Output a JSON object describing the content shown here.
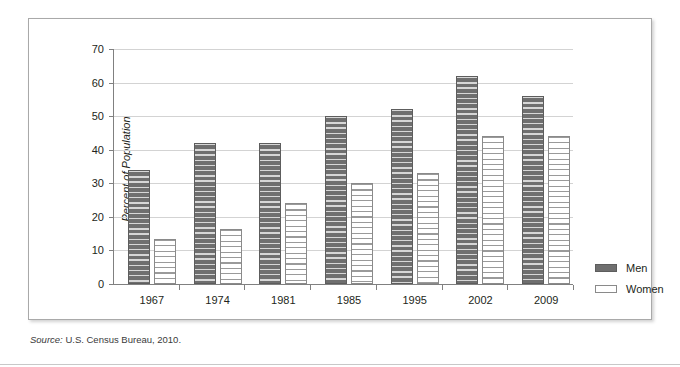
{
  "chart_data": {
    "type": "bar",
    "title": "",
    "xlabel": "",
    "ylabel": "Percent of Population",
    "ylim": [
      0,
      70
    ],
    "yticks": [
      0,
      10,
      20,
      30,
      40,
      50,
      60,
      70
    ],
    "grid": true,
    "legend_position": "right",
    "categories": [
      "1967",
      "1974",
      "1981",
      "1985",
      "1995",
      "2002",
      "2009"
    ],
    "series": [
      {
        "name": "Men",
        "color": "#6f6f6f",
        "values": [
          34,
          42,
          42,
          50,
          52,
          62,
          56
        ]
      },
      {
        "name": "Women",
        "color": "#ffffff",
        "values": [
          13.5,
          16.5,
          24,
          30,
          33,
          44,
          44
        ]
      }
    ],
    "source_prefix": "Source:",
    "source_text": "U.S. Census Bureau, 2010."
  },
  "axis": {
    "y_title": "Percent of Population",
    "y_tick_labels": [
      "0",
      "10",
      "20",
      "30",
      "40",
      "50",
      "60",
      "70"
    ],
    "x_tick_labels": [
      "1967",
      "1974",
      "1981",
      "1985",
      "1995",
      "2002",
      "2009"
    ]
  },
  "legend": {
    "items": [
      {
        "label": "Men"
      },
      {
        "label": "Women"
      }
    ]
  },
  "footer": {
    "source_prefix": "Source:",
    "source_body": " U.S. Census Bureau, 2010."
  }
}
